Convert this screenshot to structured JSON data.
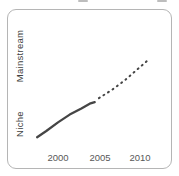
{
  "colors": {
    "line": "#454545",
    "card_border": "#b5b5b5",
    "tick_text": "#585858",
    "axis_label_text": "#414141"
  },
  "chart_data": {
    "type": "line",
    "title": "",
    "xlabel": "",
    "ylabel": "",
    "x_ticks": [
      "2000",
      "2005",
      "2010"
    ],
    "y_axis_labels": [
      "Niche",
      "Mainstream"
    ],
    "axes_drawn": false,
    "grid": false,
    "legend": "none",
    "y_scale_note": "qualitative 0=Niche baseline, 1=Mainstream top of drawn line",
    "series": [
      {
        "name": "solid-line-historical",
        "style": "solid",
        "points": [
          [
            1997.5,
            0.01
          ],
          [
            1998.6,
            0.09
          ],
          [
            2000.0,
            0.2
          ],
          [
            2001.4,
            0.3
          ],
          [
            2002.8,
            0.38
          ],
          [
            2003.8,
            0.44
          ],
          [
            2004.4,
            0.46
          ]
        ]
      },
      {
        "name": "dashed-line-projection",
        "style": "dashed",
        "points": [
          [
            2004.9,
            0.51
          ],
          [
            2006.5,
            0.62
          ],
          [
            2008.0,
            0.74
          ],
          [
            2009.5,
            0.88
          ],
          [
            2010.8,
            1.0
          ]
        ]
      }
    ]
  }
}
